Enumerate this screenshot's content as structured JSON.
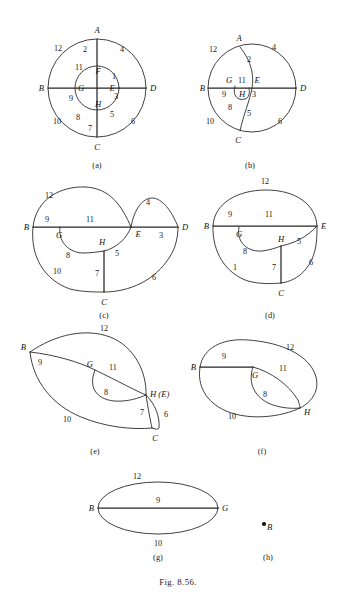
{
  "page": {
    "figure_caption": "Fig. 8.56.",
    "header_text": ""
  },
  "subfigures": [
    {
      "id": "a",
      "caption": "(a)",
      "nodes": [
        "A",
        "B",
        "C",
        "D",
        "E",
        "F",
        "G",
        "H"
      ],
      "edge_labels": [
        "1",
        "2",
        "3",
        "4",
        "5",
        "6",
        "7",
        "8",
        "9",
        "10",
        "11",
        "12"
      ],
      "description": "two concentric circles with vertical and horizontal diameters"
    },
    {
      "id": "b",
      "caption": "(b)",
      "nodes": [
        "A",
        "B",
        "C",
        "D",
        "E",
        "G",
        "H"
      ],
      "edge_labels": [
        "2",
        "3",
        "4",
        "5",
        "6",
        "8",
        "9",
        "10",
        "11",
        "12"
      ],
      "description": "circle with horizontal diameter B-D and curve A-E-H-C"
    },
    {
      "id": "c",
      "caption": "(c)",
      "nodes": [
        "B",
        "C",
        "D",
        "E",
        "G",
        "H"
      ],
      "edge_labels": [
        "3",
        "4",
        "5",
        "6",
        "7",
        "8",
        "9",
        "10",
        "11",
        "12"
      ],
      "description": "lens shapes on line B-E-D with loop G-H and spur H-C"
    },
    {
      "id": "d",
      "caption": "(d)",
      "nodes": [
        "B",
        "C",
        "E",
        "G",
        "H"
      ],
      "edge_labels": [
        "1",
        "5",
        "6",
        "7",
        "8",
        "9",
        "11",
        "12"
      ],
      "description": "oval with chord B-E, inner loop G-H, spur H-C"
    },
    {
      "id": "e",
      "caption": "(e)",
      "nodes": [
        "B",
        "C",
        "G",
        "H (E)"
      ],
      "edge_labels": [
        "6",
        "7",
        "8",
        "9",
        "10",
        "11",
        "12"
      ],
      "description": "leaf shape from B to H(E) with C at lower right"
    },
    {
      "id": "f",
      "caption": "(f)",
      "nodes": [
        "B",
        "G",
        "H"
      ],
      "edge_labels": [
        "8",
        "9",
        "10",
        "11",
        "12"
      ],
      "description": "oval from B to H with inner loop G-H"
    },
    {
      "id": "g",
      "caption": "(g)",
      "nodes": [
        "B",
        "G"
      ],
      "edge_labels": [
        "9",
        "10",
        "12"
      ],
      "description": "ellipse with horizontal chord B-G"
    },
    {
      "id": "h",
      "caption": "(h)",
      "nodes": [
        "B"
      ],
      "edge_labels": [],
      "description": "single isolated vertex B"
    }
  ],
  "fig_a": {
    "nodes": {
      "A": "A",
      "B": "B",
      "C": "C",
      "D": "D",
      "E": "E",
      "F": "F",
      "G": "G",
      "H": "H"
    },
    "labels": {
      "n1": "1",
      "n2": "2",
      "n3": "3",
      "n4": "4",
      "n5": "5",
      "n6": "6",
      "n7": "7",
      "n8": "8",
      "n9": "9",
      "n10": "10",
      "n11": "11",
      "n12": "12"
    }
  },
  "fig_b": {
    "nodes": {
      "A": "A",
      "B": "B",
      "C": "C",
      "D": "D",
      "E": "E",
      "G": "G",
      "H": "H"
    },
    "labels": {
      "n2": "2",
      "n3": "3",
      "n4": "4",
      "n5": "5",
      "n6": "6",
      "n8": "8",
      "n9": "9",
      "n10": "10",
      "n11": "11",
      "n12": "12"
    }
  },
  "fig_c": {
    "nodes": {
      "B": "B",
      "C": "C",
      "D": "D",
      "E": "E",
      "G": "G",
      "H": "H"
    },
    "labels": {
      "n3": "3",
      "n4": "4",
      "n5": "5",
      "n6": "6",
      "n7": "7",
      "n8": "8",
      "n9": "9",
      "n10": "10",
      "n11": "11",
      "n12": "12"
    }
  },
  "fig_d": {
    "nodes": {
      "B": "B",
      "C": "C",
      "E": "E",
      "G": "G",
      "H": "H"
    },
    "labels": {
      "n1": "1",
      "n5": "5",
      "n6": "6",
      "n7": "7",
      "n8": "8",
      "n9": "9",
      "n11": "11",
      "n12": "12"
    }
  },
  "fig_e": {
    "nodes": {
      "B": "B",
      "C": "C",
      "G": "G",
      "HE": "H (E)"
    },
    "labels": {
      "n6": "6",
      "n7": "7",
      "n8": "8",
      "n9": "9",
      "n10": "10",
      "n11": "11",
      "n12": "12"
    }
  },
  "fig_f": {
    "nodes": {
      "B": "B",
      "G": "G",
      "H": "H"
    },
    "labels": {
      "n8": "8",
      "n9": "9",
      "n10": "10",
      "n11": "11",
      "n12": "12"
    }
  },
  "fig_g": {
    "nodes": {
      "B": "B",
      "G": "G"
    },
    "labels": {
      "n9": "9",
      "n10": "10",
      "n12": "12"
    }
  },
  "fig_h": {
    "nodes": {
      "B": "B"
    }
  },
  "captions": {
    "a": "(a)",
    "b": "(b)",
    "c": "(c)",
    "d": "(d)",
    "e": "(e)",
    "f": "(f)",
    "g": "(g)",
    "h": "(h)"
  }
}
